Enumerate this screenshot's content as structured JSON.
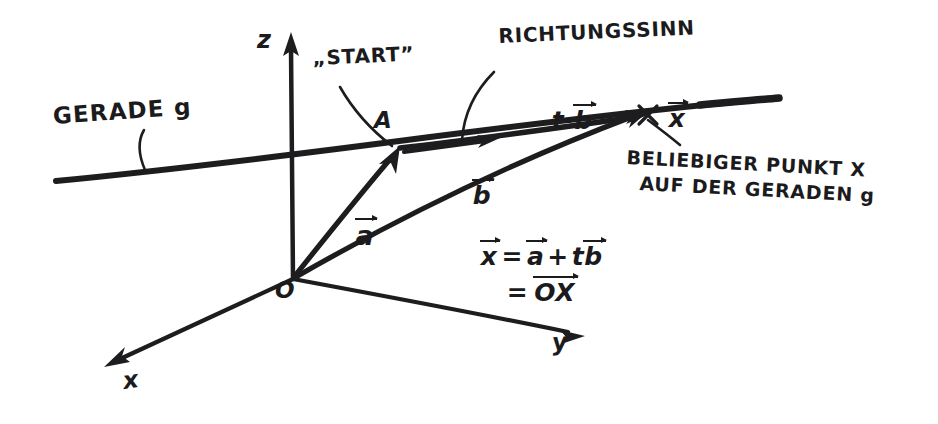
{
  "diagram": {
    "type": "hand-drawn-vector-diagram",
    "background_color": "#ffffff",
    "ink_color": "#1d1d1f",
    "width": 938,
    "height": 424
  },
  "axes": {
    "z_label": "z",
    "x_label": "x",
    "y_label": "y",
    "origin_label": "O"
  },
  "points": {
    "a_point_label": "A",
    "x_point_mark": "×"
  },
  "labels": {
    "line_g": "GERADE g",
    "start": "„START”",
    "direction_sense": "RICHTUNGSSINN",
    "vec_a": "a",
    "vec_b": "b",
    "vec_tb_scalar": "t·",
    "vec_tb_vector": "b",
    "vec_x": "x",
    "arbitrary_point_line1": "BELIEBIGER PUNKT X",
    "arbitrary_point_line2": "AUF DER GERADEN g"
  },
  "formula": {
    "lhs": "x",
    "eq1": "=",
    "term_a": "a",
    "plus": "+",
    "term_t": "t",
    "term_b": "b",
    "eq2": "=",
    "term_ox": "OX"
  }
}
